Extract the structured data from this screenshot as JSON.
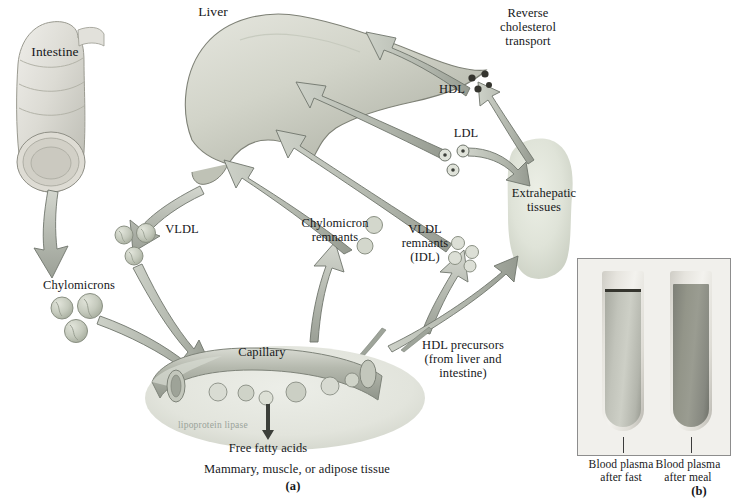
{
  "figure": {
    "panel_a_label": "(a)",
    "panel_b_label": "(b)"
  },
  "organs": {
    "intestine": "Intestine",
    "liver": "Liver",
    "extrahepatic": "Extrahepatic\ntissues",
    "capillary": "Capillary"
  },
  "particles": {
    "chylomicrons": "Chylomicrons",
    "vldl": "VLDL",
    "chylomicron_remnants": "Chylomicron\nremnants",
    "vldl_remnants": "VLDL\nremnants\n(IDL)",
    "ldl": "LDL",
    "hdl": "HDL",
    "hdl_precursors": "HDL precursors\n(from liver and\nintestine)"
  },
  "processes": {
    "reverse_cholesterol_transport": "Reverse\ncholesterol\ntransport",
    "lipoprotein_lipase": "lipoprotein lipase",
    "free_fatty_acids": "Free fatty acids",
    "tissues": "Mammary, muscle, or adipose tissue"
  },
  "panel_b": {
    "left_caption": "Blood plasma\nafter fast",
    "right_caption": "Blood plasma\nafter meal"
  },
  "colors": {
    "arrow_fill": "#b9bcb4",
    "arrow_head": "#9aa096",
    "arrow_stroke": "#6f756c",
    "organ_fill": "#ccd0c6",
    "particle_fill": "#c3c9bd",
    "hdl_dot": "#3a3a38",
    "tube_fast": "#b9bbb2",
    "tube_meal": "#8d8f86",
    "panel_bg": "#f1f0ec",
    "text": "#16181a"
  }
}
